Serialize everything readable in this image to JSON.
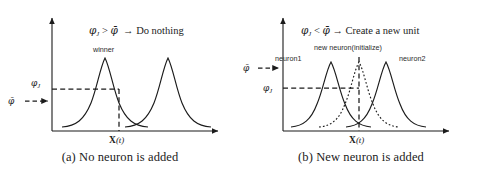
{
  "figure": {
    "title_alt": "Novelty criterion for dynamic neuron allocation",
    "background_color": "#ffffff",
    "stroke_color": "#1b1b1b",
    "panels": [
      {
        "id": "a",
        "caption": "(a) No neuron is added",
        "condition": {
          "lhs": "φ",
          "lhs_sub": "J",
          "operator": ">",
          "rhs": "φ̄",
          "arrow": "→",
          "consequence": "Do nothing"
        },
        "axis": {
          "x_tick_label_bold": "X",
          "x_tick_label_paren_open": "(",
          "x_tick_label_italic": "t",
          "x_tick_label_paren_close": ")",
          "y_labels": [
            {
              "name": "phi-J",
              "glyph": "φ",
              "sub": "J"
            },
            {
              "name": "phi-bar",
              "glyph": "φ̄",
              "sub": ""
            }
          ]
        },
        "curve_labels": [
          {
            "name": "winner",
            "text": "winner"
          }
        ],
        "curves": [
          {
            "name": "winner-neuron",
            "style": "solid",
            "center": 105,
            "peak_height": 76,
            "width": 26
          },
          {
            "name": "second-neuron",
            "style": "solid",
            "center": 168,
            "peak_height": 76,
            "width": 26
          }
        ]
      },
      {
        "id": "b",
        "caption": "(b) New neuron is added",
        "condition": {
          "lhs": "φ",
          "lhs_sub": "J",
          "operator": "<",
          "rhs": "φ̄",
          "arrow": "→",
          "consequence": "Create a new unit"
        },
        "axis": {
          "x_tick_label_bold": "X",
          "x_tick_label_paren_open": "(",
          "x_tick_label_italic": "t",
          "x_tick_label_paren_close": ")",
          "y_labels": [
            {
              "name": "phi-bar",
              "glyph": "φ̄",
              "sub": ""
            },
            {
              "name": "phi-J",
              "glyph": "φ",
              "sub": "J"
            }
          ]
        },
        "curve_labels": [
          {
            "name": "neuron1",
            "text": "neuron1"
          },
          {
            "name": "new-neuron",
            "text": "new neuron(initialize)"
          },
          {
            "name": "neuron2",
            "text": "neuron2"
          }
        ],
        "curves": [
          {
            "name": "neuron1",
            "style": "solid",
            "center": 74,
            "peak_height": 72,
            "width": 25
          },
          {
            "name": "new-neuron-initialize",
            "style": "dotted",
            "center": 104,
            "peak_height": 72,
            "width": 25
          },
          {
            "name": "neuron2",
            "style": "solid",
            "center": 140,
            "peak_height": 72,
            "width": 25
          }
        ]
      }
    ]
  }
}
